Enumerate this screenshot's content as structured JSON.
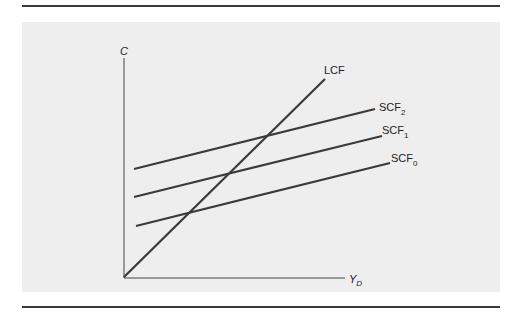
{
  "chart_data": {
    "type": "line",
    "title": "",
    "xlabel": "Y_D",
    "ylabel": "C",
    "grid": false,
    "axis_labels": {
      "y": "C",
      "x_main": "Y",
      "x_sub": "D"
    },
    "series": [
      {
        "name": "LCF",
        "label_main": "LCF",
        "label_sub": "",
        "x1": 124,
        "y1": 277,
        "x2": 325,
        "y2": 79
      },
      {
        "name": "SCF2",
        "label_main": "SCF",
        "label_sub": "2",
        "x1": 134,
        "y1": 169,
        "x2": 375,
        "y2": 109
      },
      {
        "name": "SCF1",
        "label_main": "SCF",
        "label_sub": "1",
        "x1": 134,
        "y1": 197,
        "x2": 382,
        "y2": 136
      },
      {
        "name": "SCF0",
        "label_main": "SCF",
        "label_sub": "0",
        "x1": 136,
        "y1": 226,
        "x2": 390,
        "y2": 163
      }
    ]
  }
}
